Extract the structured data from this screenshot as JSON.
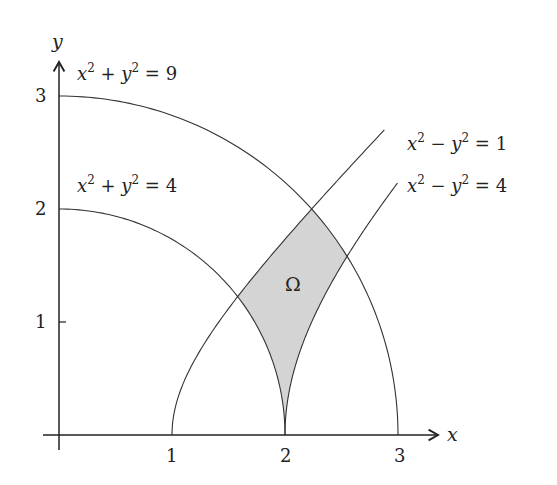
{
  "figure": {
    "axes": {
      "x_label": "x",
      "y_label": "y",
      "x_ticks": [
        "1",
        "2",
        "3"
      ],
      "y_ticks": [
        "1",
        "2",
        "3"
      ]
    },
    "curves": [
      {
        "id": "circle-r3",
        "label_base": "x",
        "label_mid": " + y",
        "label_rhs": " = 9",
        "equation": "x^2 + y^2 = 9"
      },
      {
        "id": "circle-r2",
        "label_base": "x",
        "label_mid": " + y",
        "label_rhs": " = 4",
        "equation": "x^2 + y^2 = 4"
      },
      {
        "id": "hyperbola-1",
        "label_base": "x",
        "label_mid": " − y",
        "label_rhs": " = 1",
        "equation": "x^2 - y^2 = 1"
      },
      {
        "id": "hyperbola-4",
        "label_base": "x",
        "label_mid": " − y",
        "label_rhs": " = 4",
        "equation": "x^2 - y^2 = 4"
      }
    ],
    "region": {
      "label": "Ω",
      "fill": "#d4d4d4"
    },
    "stroke_color": "#333333",
    "exponent": "2"
  }
}
